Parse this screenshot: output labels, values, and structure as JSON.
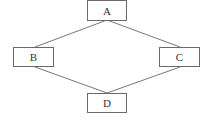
{
  "diagram": {
    "nodes": [
      {
        "id": "A",
        "label": "A",
        "x": 87,
        "y": 0,
        "w": 40,
        "h": 20
      },
      {
        "id": "B",
        "label": "B",
        "x": 13,
        "y": 47,
        "w": 40,
        "h": 20
      },
      {
        "id": "C",
        "label": "C",
        "x": 159,
        "y": 47,
        "w": 40,
        "h": 20
      },
      {
        "id": "D",
        "label": "D",
        "x": 87,
        "y": 93,
        "w": 40,
        "h": 20
      }
    ],
    "edges": [
      {
        "from": "A",
        "to": "B"
      },
      {
        "from": "A",
        "to": "C"
      },
      {
        "from": "B",
        "to": "D"
      },
      {
        "from": "C",
        "to": "D"
      }
    ],
    "colors": {
      "stroke": "#6a6a6a",
      "background": "#ffffff",
      "text": "#333333"
    }
  }
}
